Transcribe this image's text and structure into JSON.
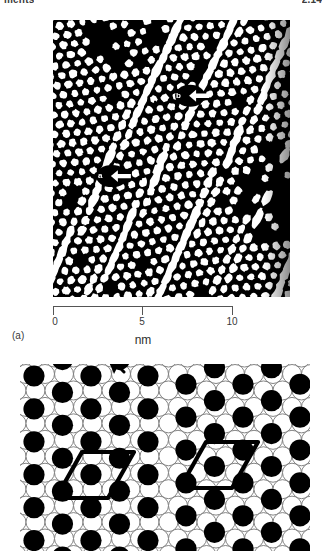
{
  "header": {
    "left_text": "ments",
    "right_text": "2.14"
  },
  "figure": {
    "panel_a": {
      "panel_label": "(a)",
      "type": "stm-image",
      "description": "Scanning tunnelling microscope topograph of a reconstructed surface showing a close packed array of bright protrusions crossed by dislocation / domain wall lines",
      "background_color": "#000000",
      "feature_color": "#ffffff",
      "markers": [
        {
          "id": "a",
          "label": "a",
          "x_pct": 24,
          "y_pct": 56,
          "arrow": "right"
        },
        {
          "id": "b",
          "label": "b",
          "x_pct": 57,
          "y_pct": 27,
          "arrow": "right"
        }
      ],
      "scale": {
        "unit": "nm",
        "min": 0,
        "max": 10,
        "ticks": [
          {
            "value": "0",
            "pos_pct": 0
          },
          {
            "value": "5",
            "pos_pct": 50
          },
          {
            "value": "10",
            "pos_pct": 100
          }
        ],
        "axis_color": "#555555"
      }
    },
    "panel_b": {
      "type": "ball-model",
      "description": "Hard sphere ball model of the surface reconstruction: large open circles are substrate atoms, filled black circles are adatoms; two rhombic unit cells are outlined and an arrow marks the domain wall direction",
      "open_circle_fill": "#ffffff",
      "open_circle_stroke": "#777777",
      "filled_circle_fill": "#000000",
      "unit_cell_color": "#000000",
      "annotations": [
        {
          "id": "domain-wall-arrow",
          "shape": "arrow",
          "direction": "down-left"
        },
        {
          "id": "unit-cell-left",
          "shape": "rhombus"
        },
        {
          "id": "unit-cell-right",
          "shape": "rhombus"
        }
      ]
    }
  }
}
